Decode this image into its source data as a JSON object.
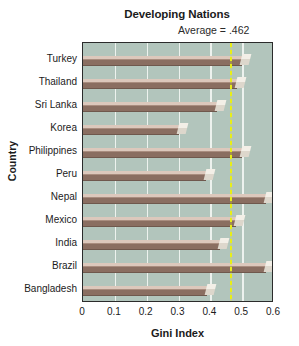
{
  "chart_data": {
    "type": "bar",
    "orientation": "horizontal",
    "title": "Developing Nations",
    "xlabel": "Gini Index",
    "ylabel": "Country",
    "categories": [
      "Turkey",
      "Thailand",
      "Sri Lanka",
      "Korea",
      "Philippines",
      "Peru",
      "Nepal",
      "Mexico",
      "India",
      "Brazil",
      "Bangladesh"
    ],
    "values": [
      0.5,
      0.485,
      0.42,
      0.3,
      0.5,
      0.385,
      0.575,
      0.48,
      0.43,
      0.575,
      0.39
    ],
    "xlim": [
      0,
      0.6
    ],
    "xticks": [
      "0",
      "0.1",
      "0.2",
      "0.3",
      "0.4",
      "0.5",
      "0.6"
    ],
    "xtick_values": [
      0,
      0.1,
      0.2,
      0.3,
      0.4,
      0.5,
      0.6
    ],
    "grid": "vertical",
    "legend": "none",
    "annotations": [
      {
        "name": "average-line",
        "label": "Average = .462",
        "value": 0.462,
        "style": "dashed-vertical"
      }
    ],
    "colors": {
      "plot_background": "#b2c5bc",
      "bar_body": "#8a6e61",
      "bar_highlight": "#dcc8bc",
      "bar_cap": "#f3efe7",
      "gridline": "#f2f5f2",
      "average_line": "#e8ee17",
      "axis_border": "#2b2b2b",
      "text": "#1b1b1b",
      "page_background": "#ffffff"
    }
  }
}
